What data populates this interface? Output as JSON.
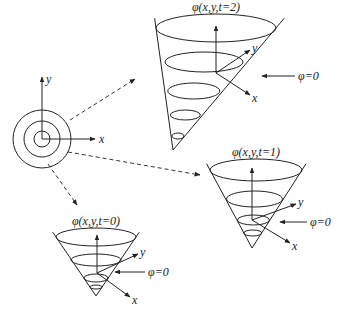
{
  "diagram": {
    "contour_plot": {
      "center": [
        42,
        139
      ],
      "radii": [
        8,
        18,
        29
      ],
      "x_label": "x",
      "y_label": "y"
    },
    "cones": [
      {
        "id": "t2",
        "label": "φ(x,y,t=2)",
        "zero_label": "φ=0",
        "x_label": "x",
        "y_label": "y",
        "apex": [
          173,
          150
        ],
        "top": [
          216,
          28
        ],
        "rx": 60,
        "ry": 14,
        "slices": [
          {
            "cy": 62,
            "rx": 39,
            "ry": 10
          },
          {
            "cy": 91,
            "rx": 26,
            "ry": 8
          },
          {
            "cy": 115,
            "rx": 15,
            "ry": 5
          },
          {
            "cy": 136,
            "rx": 6,
            "ry": 3
          }
        ],
        "zero_slice": 1,
        "zero_arrow": [
          [
            295,
            76
          ],
          [
            262,
            76
          ]
        ],
        "zero_text": [
          298,
          80
        ],
        "y_axis_end": [
          250,
          50
        ],
        "x_axis_end": [
          250,
          95
        ],
        "origin": [
          216,
          73
        ]
      },
      {
        "id": "t1",
        "label": "φ(x,y,t=1)",
        "zero_label": "φ=0",
        "x_label": "x",
        "y_label": "y",
        "apex": [
          252,
          248
        ],
        "top": [
          256,
          170
        ],
        "rx": 46,
        "ry": 11,
        "slices": [
          {
            "cy": 199,
            "rx": 28,
            "ry": 8
          },
          {
            "cy": 220,
            "rx": 16,
            "ry": 5
          },
          {
            "cy": 233,
            "rx": 9,
            "ry": 3
          }
        ],
        "zero_slice": 1,
        "zero_arrow": [
          [
            307,
            222
          ],
          [
            280,
            222
          ]
        ],
        "zero_text": [
          310,
          226
        ],
        "y_axis_end": [
          296,
          204
        ],
        "x_axis_end": [
          290,
          243
        ],
        "origin": [
          252,
          220
        ]
      },
      {
        "id": "t0",
        "label": "φ(x,y,t=0)",
        "zero_label": "φ=0",
        "x_label": "x",
        "y_label": "y",
        "apex": [
          96,
          296
        ],
        "top": [
          96,
          237
        ],
        "rx": 40,
        "ry": 9,
        "slices": [
          {
            "cy": 260,
            "rx": 25,
            "ry": 6
          },
          {
            "cy": 278,
            "rx": 12,
            "ry": 4
          },
          {
            "cy": 287,
            "rx": 6,
            "ry": 2
          }
        ],
        "zero_slice": 1,
        "zero_arrow": [
          [
            145,
            272
          ],
          [
            115,
            272
          ]
        ],
        "zero_text": [
          148,
          276
        ],
        "y_axis_end": [
          138,
          254
        ],
        "x_axis_end": [
          130,
          297
        ],
        "origin": [
          97,
          273
        ]
      }
    ],
    "arrows": [
      {
        "from": [
          70,
          120
        ],
        "to": [
          135,
          79
        ],
        "target": "t2"
      },
      {
        "from": [
          68,
          152
        ],
        "to": [
          200,
          175
        ],
        "target": "t1"
      },
      {
        "from": [
          48,
          164
        ],
        "to": [
          77,
          205
        ],
        "target": "t0"
      }
    ]
  }
}
